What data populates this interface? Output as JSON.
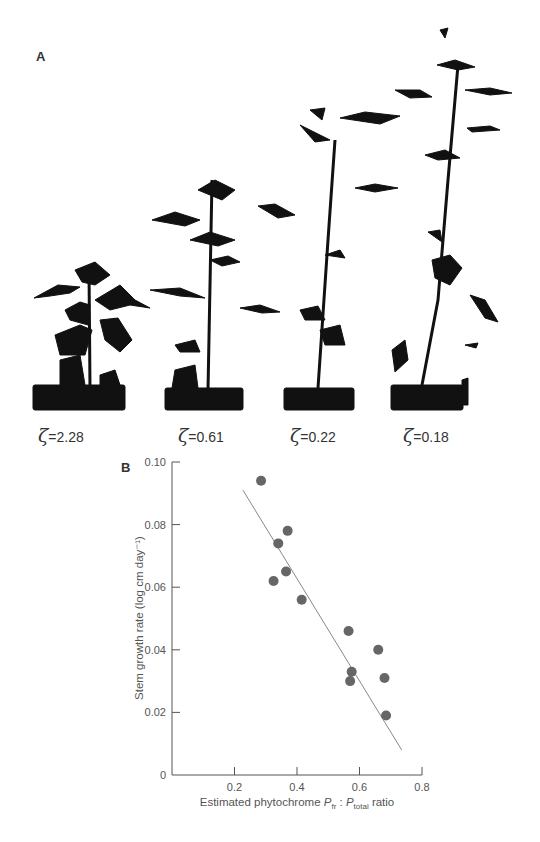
{
  "figure": {
    "panel_a_label": "A",
    "panel_b_label": "B",
    "plants": [
      {
        "symbol": "ζ",
        "value_text": "=2.28"
      },
      {
        "symbol": "ζ",
        "value_text": "=0.61"
      },
      {
        "symbol": "ζ",
        "value_text": "=0.22"
      },
      {
        "symbol": "ζ",
        "value_text": "=0.18"
      }
    ]
  },
  "chart_data": {
    "type": "scatter",
    "title": "",
    "xlabel": "Estimated phytochrome Pfr : Ptotal ratio",
    "xlabel_parts": {
      "prefix": "Estimated phytochrome ",
      "p1": "P",
      "p1_sub": "fr",
      "sep": " : ",
      "p2": "P",
      "p2_sub": "total",
      "suffix": " ratio"
    },
    "ylabel": "Stem growth rate (log cm day⁻¹)",
    "xlim": [
      0,
      0.8
    ],
    "ylim": [
      0,
      0.1
    ],
    "x_ticks": [
      "0.2",
      "0.4",
      "0.6",
      "0.8"
    ],
    "y_ticks": [
      "0",
      "0.02",
      "0.04",
      "0.06",
      "0.08",
      "0.10"
    ],
    "grid": false,
    "legend": null,
    "points": [
      {
        "x": 0.285,
        "y": 0.094
      },
      {
        "x": 0.37,
        "y": 0.078
      },
      {
        "x": 0.34,
        "y": 0.074
      },
      {
        "x": 0.365,
        "y": 0.065
      },
      {
        "x": 0.325,
        "y": 0.062
      },
      {
        "x": 0.415,
        "y": 0.056
      },
      {
        "x": 0.565,
        "y": 0.046
      },
      {
        "x": 0.66,
        "y": 0.04
      },
      {
        "x": 0.575,
        "y": 0.033
      },
      {
        "x": 0.57,
        "y": 0.03
      },
      {
        "x": 0.68,
        "y": 0.031
      },
      {
        "x": 0.685,
        "y": 0.019
      }
    ],
    "regression_line": {
      "x1": 0.227,
      "y1": 0.091,
      "x2": 0.735,
      "y2": 0.008
    },
    "colors": {
      "points": "#666666",
      "line": "#888888",
      "axis": "#555555"
    }
  }
}
